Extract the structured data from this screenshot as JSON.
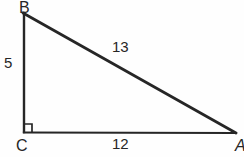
{
  "figure": {
    "type": "right-triangle-diagram",
    "background_color": "#fefefe",
    "stroke_color": "#262626",
    "vertices": [
      {
        "name": "B",
        "label": "B",
        "x": 23,
        "y": 13
      },
      {
        "name": "C",
        "label": "C",
        "x": 24,
        "y": 132
      },
      {
        "name": "A",
        "label": "A",
        "x": 236,
        "y": 133
      }
    ],
    "sides": [
      {
        "name": "leg-vertical",
        "from": "B",
        "to": "C",
        "length_label": "5"
      },
      {
        "name": "leg-horizontal",
        "from": "C",
        "to": "A",
        "length_label": "12"
      },
      {
        "name": "hypotenuse",
        "from": "B",
        "to": "A",
        "length_label": "13"
      }
    ],
    "right_angle": {
      "at": "C",
      "marker": "square",
      "size": 7
    },
    "labels": {
      "vertex_b": "B",
      "vertex_c": "C",
      "vertex_a": "A",
      "side_bc": "5",
      "side_ca": "12",
      "side_ba": "13"
    }
  }
}
